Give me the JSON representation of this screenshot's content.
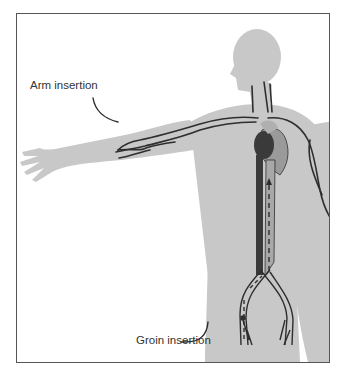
{
  "figure": {
    "labels": {
      "arm": "Arm insertion",
      "groin": "Groin insertion"
    },
    "colors": {
      "silhouette": "#c8c8c8",
      "vessel": "#2e2e2e",
      "heart_dark": "#3a3a3a",
      "heart_light": "#9a9a9a",
      "frame": "#555555"
    }
  }
}
